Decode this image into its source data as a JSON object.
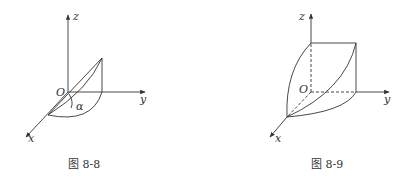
{
  "figures": [
    {
      "id": "fig-8-8",
      "caption": "图 8-8",
      "axes": {
        "x": "x",
        "y": "y",
        "z": "z"
      },
      "origin_label": "O",
      "angle_label": "α"
    },
    {
      "id": "fig-8-9",
      "caption": "图 8-9",
      "axes": {
        "x": "x",
        "y": "y",
        "z": "z"
      },
      "origin_label": "O"
    }
  ],
  "colors": {
    "stroke": "#333333",
    "background": "#ffffff"
  }
}
